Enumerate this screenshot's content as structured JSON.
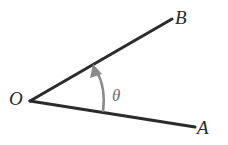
{
  "diagram": {
    "type": "angle",
    "vertex": {
      "label": "O",
      "x": 30,
      "y": 101
    },
    "rays": [
      {
        "name": "OB",
        "label": "B",
        "end": {
          "x": 172,
          "y": 19
        }
      },
      {
        "name": "OA",
        "label": "A",
        "end": {
          "x": 195,
          "y": 127
        }
      }
    ],
    "angle": {
      "label": "θ",
      "direction": "counterclockwise from OA to OB",
      "arc_color": "#8a8a8a"
    },
    "labels": {
      "O": "O",
      "A": "A",
      "B": "B",
      "theta": "θ"
    },
    "colors": {
      "ray": "#2b2b2b",
      "arc": "#8a8a8a",
      "background": "#ffffff"
    }
  }
}
